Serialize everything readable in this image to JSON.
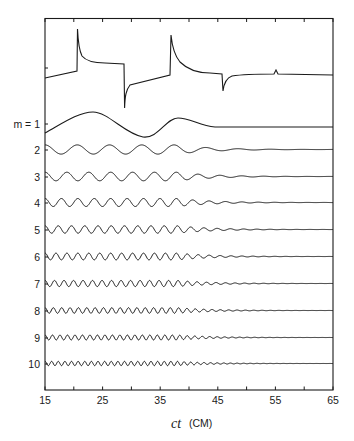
{
  "chart_data": {
    "type": "line",
    "title": "",
    "xlabel": "ct",
    "xlabel_unit": "(CM)",
    "ylabel": "",
    "xlim": [
      15,
      65
    ],
    "x_ticks": [
      15,
      25,
      35,
      45,
      55,
      65
    ],
    "x_minor_ticks": [
      20,
      30,
      40,
      50,
      60
    ],
    "grid": false,
    "legend": null,
    "series": [
      {
        "name": "total",
        "label": "",
        "description": "Sum signal with sharp spikes",
        "key_points": [
          {
            "x": 15,
            "y": -0.1
          },
          {
            "x": 20.5,
            "y": 0.05
          },
          {
            "x": 20.6,
            "y": 1.0
          },
          {
            "x": 21.5,
            "y": 0.35
          },
          {
            "x": 28.5,
            "y": 0.3
          },
          {
            "x": 28.7,
            "y": -0.9
          },
          {
            "x": 30,
            "y": -0.35
          },
          {
            "x": 37.2,
            "y": -0.2
          },
          {
            "x": 37.3,
            "y": 0.9
          },
          {
            "x": 40,
            "y": 0.0
          },
          {
            "x": 45.8,
            "y": -0.05
          },
          {
            "x": 45.9,
            "y": -0.45
          },
          {
            "x": 47,
            "y": -0.05
          },
          {
            "x": 55,
            "y": -0.02
          },
          {
            "x": 55.2,
            "y": 0.08
          },
          {
            "x": 56,
            "y": -0.02
          },
          {
            "x": 65,
            "y": -0.02
          }
        ]
      },
      {
        "name": "m=1",
        "label": "m = 1",
        "period": 14,
        "amplitude": 1.0,
        "damping_start": 45
      },
      {
        "name": "m=2",
        "label": "2",
        "period": 5.6,
        "amplitude": 1.0,
        "damping_start": 50
      },
      {
        "name": "m=3",
        "label": "3",
        "period": 3.8,
        "amplitude": 1.0,
        "damping_start": 50
      },
      {
        "name": "m=4",
        "label": "4",
        "period": 2.85,
        "amplitude": 1.0,
        "damping_start": 50
      },
      {
        "name": "m=5",
        "label": "5",
        "period": 2.3,
        "amplitude": 1.0,
        "damping_start": 50
      },
      {
        "name": "m=6",
        "label": "6",
        "period": 1.9,
        "amplitude": 1.0,
        "damping_start": 50
      },
      {
        "name": "m=7",
        "label": "7",
        "period": 1.65,
        "amplitude": 1.0,
        "damping_start": 50
      },
      {
        "name": "m=8",
        "label": "8",
        "period": 1.45,
        "amplitude": 1.0,
        "damping_start": 50
      },
      {
        "name": "m=9",
        "label": "9",
        "period": 1.3,
        "amplitude": 1.0,
        "damping_start": 50
      },
      {
        "name": "m=10",
        "label": "10",
        "period": 1.15,
        "amplitude": 1.0,
        "damping_start": 50
      }
    ]
  },
  "axis": {
    "tick_labels": [
      "15",
      "25",
      "35",
      "45",
      "55",
      "65"
    ],
    "xlabel_var": "ct",
    "xlabel_unit": "(CM)"
  },
  "rows": {
    "labels": [
      "m = 1",
      "2",
      "3",
      "4",
      "5",
      "6",
      "7",
      "8",
      "9",
      "10"
    ]
  }
}
